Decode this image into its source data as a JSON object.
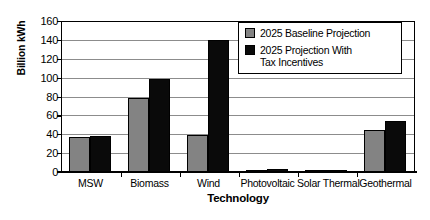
{
  "chart_data": {
    "type": "bar",
    "title": "",
    "xlabel": "Technology",
    "ylabel": "Billion kWh",
    "categories": [
      "MSW",
      "Biomass",
      "Wind",
      "Photovoltaic",
      "Solar Thermal",
      "Geothermal"
    ],
    "series": [
      {
        "name": "2025 Baseline Projection",
        "color": "#838383",
        "values": [
          37,
          78,
          39,
          1,
          1,
          44
        ]
      },
      {
        "name": "2025 Projection With Tax Incentives",
        "color": "#0a0a0a",
        "values": [
          38,
          99,
          140,
          3,
          2,
          54
        ]
      }
    ],
    "ylim": [
      0,
      160
    ],
    "yticks": [
      0,
      20,
      40,
      60,
      80,
      100,
      120,
      140,
      160
    ],
    "ytick_labels": [
      "0",
      "20",
      "40",
      "60",
      "80",
      "100",
      "120",
      "140",
      "160"
    ],
    "grid": true,
    "grid_axis": "y",
    "legend_position": "upper right",
    "legend": [
      {
        "label_line1": "2025 Baseline Projection",
        "label_line2": ""
      },
      {
        "label_line1": "2025 Projection With",
        "label_line2": "Tax Incentives"
      }
    ]
  }
}
